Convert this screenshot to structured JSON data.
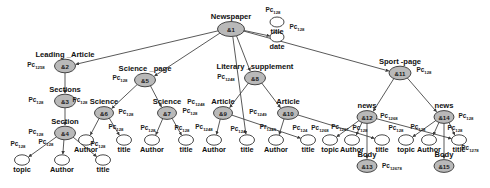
{
  "diagram": {
    "colors": {
      "internal_node_fill": "#b9b9b9",
      "leaf_node_fill": "#ffffff",
      "stroke": "#333333",
      "text": "#111111",
      "background": "#ffffff"
    },
    "edge_label_prefix": "Pc",
    "internal_nodes": [
      {
        "id": "&1",
        "type": "Newspaper",
        "x": 231,
        "y": 29,
        "rx": 13.5,
        "ry": 7.5
      },
      {
        "id": "&2",
        "type": "Leading _Article",
        "x": 65,
        "y": 66,
        "rx": 10.5,
        "ry": 6.8
      },
      {
        "id": "&3",
        "type": "Sections",
        "x": 65,
        "y": 101,
        "rx": 10.5,
        "ry": 6.8
      },
      {
        "id": "&4",
        "type": "Section",
        "x": 65,
        "y": 133,
        "rx": 10.5,
        "ry": 6.8
      },
      {
        "id": "&5",
        "type": "Science _page",
        "x": 145,
        "y": 80,
        "rx": 10.5,
        "ry": 6.8
      },
      {
        "id": "&6",
        "type": "Science",
        "x": 104,
        "y": 113,
        "rx": 9.5,
        "ry": 6.4
      },
      {
        "id": "&7",
        "type": "Science",
        "x": 167,
        "y": 113,
        "rx": 9.5,
        "ry": 6.4
      },
      {
        "id": "&8",
        "type": "Literary _supplement",
        "x": 255,
        "y": 78,
        "rx": 10.5,
        "ry": 6.8
      },
      {
        "id": "&9",
        "type": "Article",
        "x": 223,
        "y": 113,
        "rx": 9.5,
        "ry": 6.4
      },
      {
        "id": "&10",
        "type": "Article",
        "x": 288,
        "y": 113,
        "rx": 10.5,
        "ry": 6.4
      },
      {
        "id": "&11",
        "type": "Sport -page",
        "x": 400,
        "y": 73,
        "rx": 11.0,
        "ry": 6.8
      },
      {
        "id": "&12",
        "type": "news",
        "x": 367,
        "y": 117,
        "rx": 10.0,
        "ry": 6.4
      },
      {
        "id": "&13",
        "type": "Body",
        "x": 367,
        "y": 166,
        "rx": 10.0,
        "ry": 6.4
      },
      {
        "id": "&14",
        "type": "news",
        "x": 444,
        "y": 117,
        "rx": 10.0,
        "ry": 6.4
      },
      {
        "id": "&15",
        "type": "Body",
        "x": 444,
        "y": 166,
        "rx": 10.0,
        "ry": 6.4
      }
    ],
    "leaf_nodes": [
      {
        "label": "title",
        "x": 277,
        "y": 22,
        "rx": 7.0,
        "ry": 5.0
      },
      {
        "label": "date",
        "x": 277,
        "y": 37,
        "rx": 7.0,
        "ry": 5.0
      },
      {
        "label": "topic",
        "x": 22,
        "y": 160,
        "rx": 7.5,
        "ry": 5.2
      },
      {
        "label": "Author",
        "x": 62,
        "y": 160,
        "rx": 7.5,
        "ry": 5.2
      },
      {
        "label": "title",
        "x": 103,
        "y": 160,
        "rx": 7.5,
        "ry": 5.2
      },
      {
        "label": "Author",
        "x": 86,
        "y": 140,
        "rx": 7.5,
        "ry": 5.2
      },
      {
        "label": "title",
        "x": 124,
        "y": 140,
        "rx": 7.5,
        "ry": 5.2
      },
      {
        "label": "Author",
        "x": 152,
        "y": 140,
        "rx": 7.5,
        "ry": 5.2
      },
      {
        "label": "title",
        "x": 186,
        "y": 140,
        "rx": 7.5,
        "ry": 5.2
      },
      {
        "label": "Author",
        "x": 214,
        "y": 140,
        "rx": 7.5,
        "ry": 5.2
      },
      {
        "label": "title",
        "x": 247,
        "y": 140,
        "rx": 7.5,
        "ry": 5.2
      },
      {
        "label": "Author",
        "x": 276,
        "y": 140,
        "rx": 7.5,
        "ry": 5.2
      },
      {
        "label": "title",
        "x": 308,
        "y": 140,
        "rx": 7.5,
        "ry": 5.2
      },
      {
        "label": "topic",
        "x": 330,
        "y": 140,
        "rx": 7.5,
        "ry": 5.2
      },
      {
        "label": "Author",
        "x": 352,
        "y": 140,
        "rx": 7.5,
        "ry": 5.2
      },
      {
        "label": "title",
        "x": 382,
        "y": 140,
        "rx": 7.5,
        "ry": 5.2
      },
      {
        "label": "topic",
        "x": 406,
        "y": 140,
        "rx": 7.5,
        "ry": 5.2
      },
      {
        "label": "Author",
        "x": 429,
        "y": 140,
        "rx": 7.5,
        "ry": 5.2
      },
      {
        "label": "title",
        "x": 459,
        "y": 140,
        "rx": 7.5,
        "ry": 5.2
      }
    ],
    "edges": [
      {
        "from": "&1",
        "to": "&2",
        "label": "Pc",
        "sub": "1258",
        "lx": 36,
        "ly": 67
      },
      {
        "from": "&1",
        "to": "&5",
        "label": "Pc",
        "sub": "128",
        "lx": 120,
        "ly": 80
      },
      {
        "from": "&1",
        "to": "&8",
        "label": "Pc",
        "sub": "1248",
        "lx": 226,
        "ly": 79
      },
      {
        "from": "&1",
        "to": "&11",
        "label": "Pc",
        "sub": "128",
        "lx": 424,
        "ly": 72
      },
      {
        "from": "&1",
        "to": "title",
        "label": "Pc",
        "sub": "128",
        "lx": 273,
        "ly": 12
      },
      {
        "from": "&1",
        "to": "date",
        "label": "Pc",
        "sub": "128",
        "lx": 297,
        "ly": 29
      },
      {
        "from": "&2",
        "to": "&3",
        "label": "Pc",
        "sub": "128",
        "lx": 36,
        "ly": 102
      },
      {
        "from": "&3",
        "to": "&4",
        "label": "Pc",
        "sub": "128",
        "lx": 36,
        "ly": 134
      },
      {
        "from": "&4",
        "to": "topic",
        "label": "Pc",
        "sub": "128",
        "lx": 18,
        "ly": 146
      },
      {
        "from": "&4",
        "to": "Author",
        "label": "Pc",
        "sub": "128",
        "lx": 46,
        "ly": 144
      },
      {
        "from": "&4",
        "to": "title",
        "label": "Pc",
        "sub": "128",
        "lx": 98,
        "ly": 146
      },
      {
        "from": "&5",
        "to": "&6",
        "label": "Pc",
        "sub": "128",
        "lx": 80,
        "ly": 102
      },
      {
        "from": "&5",
        "to": "&7",
        "label": "Pc",
        "sub": "128",
        "lx": 190,
        "ly": 113
      },
      {
        "from": "&6",
        "to": "Author",
        "label": "Pc",
        "sub": "128",
        "lx": 126,
        "ly": 114
      },
      {
        "from": "&6",
        "to": "title",
        "label": "Pc",
        "sub": "128",
        "lx": 116,
        "ly": 129
      },
      {
        "from": "&7",
        "to": "Author",
        "label": "Pc",
        "sub": "128",
        "lx": 148,
        "ly": 130
      },
      {
        "from": "&7",
        "to": "title",
        "label": "Pc",
        "sub": "128",
        "lx": 182,
        "ly": 130
      },
      {
        "from": "&8",
        "to": "&9",
        "label": "Pc",
        "sub": "1248",
        "lx": 196,
        "ly": 104
      },
      {
        "from": "&8",
        "to": "&10",
        "label": "Pc",
        "sub": "1249",
        "lx": 258,
        "ly": 114
      },
      {
        "from": "&9",
        "to": "Author",
        "label": "Pc",
        "sub": "1248",
        "lx": 204,
        "ly": 129
      },
      {
        "from": "&9",
        "to": "title",
        "label": "Pc",
        "sub": "124",
        "lx": 238,
        "ly": 131
      },
      {
        "from": "&10",
        "to": "Author",
        "label": "Pr",
        "sub": "1249",
        "lx": 268,
        "ly": 129
      },
      {
        "from": "&10",
        "to": "title",
        "label": "Pc",
        "sub": "124",
        "lx": 300,
        "ly": 130
      },
      {
        "from": "&11",
        "to": "&12",
        "label": "Pc",
        "sub": "1268",
        "lx": 389,
        "ly": 118
      },
      {
        "from": "&11",
        "to": "&14",
        "label": "Pc",
        "sub": "128",
        "lx": 466,
        "ly": 118
      },
      {
        "from": "&12",
        "to": "topic",
        "label": "Pc",
        "sub": "1268",
        "lx": 320,
        "ly": 130
      },
      {
        "from": "&12",
        "to": "Author",
        "label": "Pc",
        "sub": "1267",
        "lx": 340,
        "ly": 129
      },
      {
        "from": "&12",
        "to": "title",
        "label": "Pc",
        "sub": "128",
        "lx": 360,
        "ly": 130
      },
      {
        "from": "&12",
        "to": "&13",
        "label": "Pc",
        "sub": "12678",
        "lx": 392,
        "ly": 168
      },
      {
        "from": "&14",
        "to": "topic",
        "label": "Pc",
        "sub": "128",
        "lx": 396,
        "ly": 130
      },
      {
        "from": "&14",
        "to": "Author",
        "label": "Pc",
        "sub": "128",
        "lx": 418,
        "ly": 129
      },
      {
        "from": "&14",
        "to": "title",
        "label": "Pc",
        "sub": "128",
        "lx": 455,
        "ly": 130
      },
      {
        "from": "&14",
        "to": "&15",
        "label": "Pc",
        "sub": "1278",
        "lx": 470,
        "ly": 150
      }
    ]
  }
}
